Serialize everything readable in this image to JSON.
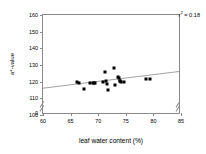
{
  "chart_data": {
    "type": "scatter",
    "title": "",
    "xlabel": "leaf water content (%)",
    "ylabel": "a*-value",
    "xlim": [
      60,
      85
    ],
    "ylim": [
      100,
      160
    ],
    "xticks": [
      60,
      65,
      70,
      75,
      80,
      85
    ],
    "yticks": [
      100,
      110,
      120,
      130,
      140,
      150,
      160
    ],
    "y_axis_break": true,
    "y_break_label": "0",
    "grid": false,
    "legend": null,
    "annotation": "r² = 0.18",
    "annotation_parts": {
      "symbol": "r",
      "exponent": "2",
      "text": " = 0.18"
    },
    "point_color": "#000000",
    "line_color": "#8a8a8a",
    "trendline": {
      "x": [
        60,
        85
      ],
      "y": [
        115.2,
        125.4
      ]
    },
    "points": [
      {
        "x": 66.2,
        "y": 119.6
      },
      {
        "x": 66.5,
        "y": 119.0
      },
      {
        "x": 67.4,
        "y": 115.9
      },
      {
        "x": 68.6,
        "y": 119.0
      },
      {
        "x": 69.0,
        "y": 119.3
      },
      {
        "x": 69.3,
        "y": 119.4
      },
      {
        "x": 69.5,
        "y": 119.2
      },
      {
        "x": 70.9,
        "y": 119.8
      },
      {
        "x": 71.3,
        "y": 126.1
      },
      {
        "x": 71.5,
        "y": 120.3
      },
      {
        "x": 71.6,
        "y": 118.4
      },
      {
        "x": 71.8,
        "y": 115.0
      },
      {
        "x": 72.9,
        "y": 128.0
      },
      {
        "x": 73.0,
        "y": 117.9
      },
      {
        "x": 73.5,
        "y": 123.0
      },
      {
        "x": 73.8,
        "y": 122.4
      },
      {
        "x": 73.9,
        "y": 120.6
      },
      {
        "x": 74.0,
        "y": 120.2
      },
      {
        "x": 74.2,
        "y": 120.1
      },
      {
        "x": 74.6,
        "y": 119.9
      },
      {
        "x": 78.6,
        "y": 121.6
      },
      {
        "x": 79.4,
        "y": 121.6
      }
    ]
  }
}
